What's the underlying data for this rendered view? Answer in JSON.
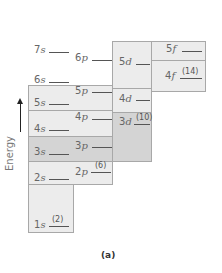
{
  "axis": {
    "label": "Energy",
    "arrow": "up-arrow"
  },
  "caption": "(a)",
  "levels": [
    {
      "id": "7s",
      "n": "7",
      "l": "s"
    },
    {
      "id": "6p",
      "n": "6",
      "l": "p"
    },
    {
      "id": "5d",
      "n": "5",
      "l": "d"
    },
    {
      "id": "5f",
      "n": "5",
      "l": "f"
    },
    {
      "id": "6s",
      "n": "6",
      "l": "s"
    },
    {
      "id": "4f",
      "n": "4",
      "l": "f",
      "capacity": "(14)"
    },
    {
      "id": "5p",
      "n": "5",
      "l": "p"
    },
    {
      "id": "5s",
      "n": "5",
      "l": "s"
    },
    {
      "id": "4d",
      "n": "4",
      "l": "d"
    },
    {
      "id": "4p",
      "n": "4",
      "l": "p"
    },
    {
      "id": "3d",
      "n": "3",
      "l": "d",
      "capacity": "(10)"
    },
    {
      "id": "4s",
      "n": "4",
      "l": "s"
    },
    {
      "id": "3p",
      "n": "3",
      "l": "p"
    },
    {
      "id": "3s",
      "n": "3",
      "l": "s"
    },
    {
      "id": "2p",
      "n": "2",
      "l": "p",
      "capacity": "(6)"
    },
    {
      "id": "2s",
      "n": "2",
      "l": "s"
    },
    {
      "id": "1s",
      "n": "1",
      "l": "s",
      "capacity": "(2)"
    }
  ],
  "colors": {
    "box_light": "#ececec",
    "box_dark": "#d4d4d4",
    "border": "#a8a8a8"
  }
}
